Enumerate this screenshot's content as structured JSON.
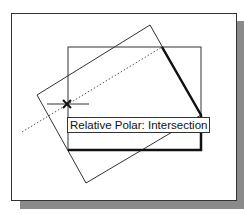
{
  "tooltip": {
    "label": "Relative Polar: Intersection"
  },
  "colors": {
    "line": "#333333",
    "bold_line": "#111111",
    "shadow": "#8a8a8a",
    "background": "#ffffff"
  },
  "icons": {
    "cursor": "crosshair-x-icon"
  }
}
